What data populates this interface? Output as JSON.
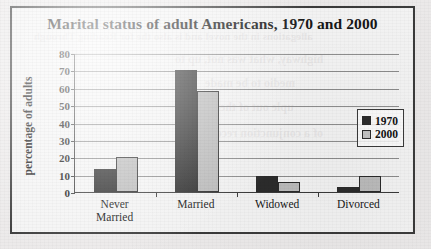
{
  "chart_data": {
    "type": "bar",
    "title": "Marital status of adult Americans, 1970 and 2000",
    "xlabel": "",
    "ylabel": "percentage of adults",
    "ylim": [
      0,
      80
    ],
    "ytick_step": 10,
    "yticks": [
      "80",
      "70",
      "60",
      "50",
      "40",
      "30",
      "20",
      "10",
      "0"
    ],
    "grid": true,
    "legend_position": "right-inside",
    "categories": [
      "Never Married",
      "Married",
      "Widowed",
      "Divorced"
    ],
    "category_lines": [
      [
        "Never",
        "Married"
      ],
      [
        "Married"
      ],
      [
        "Widowed"
      ],
      [
        "Divorced"
      ]
    ],
    "series": [
      {
        "name": "1970",
        "color": "#2c2c2c",
        "values": [
          13,
          70,
          9,
          3
        ]
      },
      {
        "name": "2000",
        "color": "#bcbcbc",
        "values": [
          20,
          58,
          6,
          9
        ]
      }
    ]
  },
  "bleed_text": [
    "allegations in the novel and is also the for Reading Through",
    "highway, what was not, up to",
    "medio to be made",
    "uple out of them",
    "of a conjunction received"
  ]
}
